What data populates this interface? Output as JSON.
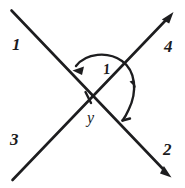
{
  "figure": {
    "background_color": "#ffffff",
    "ink_color": "#1d1d1f",
    "labels": {
      "ray_1": "1",
      "ray_2": "2",
      "ray_3": "3",
      "ray_4": "4",
      "vertex_angle": "y",
      "arc_angle": "1"
    },
    "elements": {
      "line_a_name": "line-1-2",
      "line_b_name": "line-3-4",
      "arc_name": "angle-arc",
      "intersection_name": "intersection-point"
    },
    "geometry": {
      "intersection": [
        88,
        97
      ],
      "line_a_start": [
        11,
        10
      ],
      "line_a_end": [
        171,
        177
      ],
      "line_b_start": [
        12,
        180
      ],
      "line_b_end": [
        173,
        12
      ],
      "arc_radius": 44
    }
  }
}
